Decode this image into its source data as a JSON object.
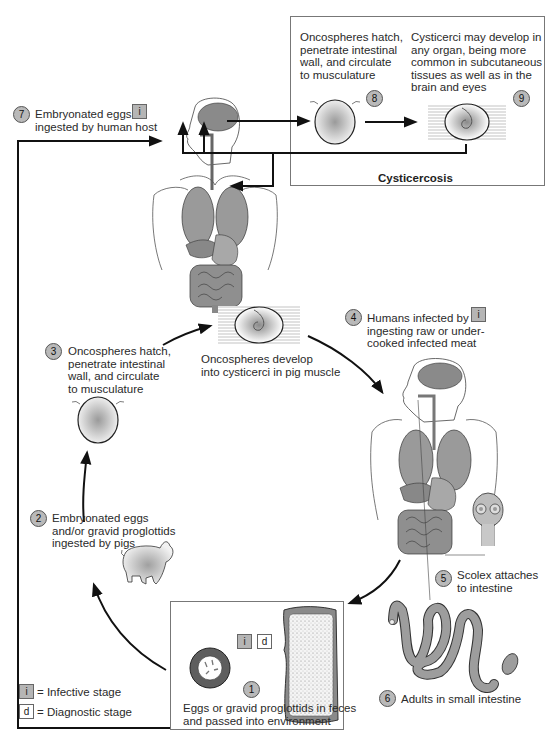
{
  "diagram": {
    "steps": [
      {
        "num": "1",
        "label": "Eggs or gravid proglottids in feces\nand passed into environment",
        "tags": [
          "i",
          "d"
        ]
      },
      {
        "num": "2",
        "label": "Embryonated eggs\nand/or gravid proglottids\ningested by pigs"
      },
      {
        "num": "3",
        "label": "Oncospheres hatch,\npenetrate intestinal\nwall, and circulate\nto musculature"
      },
      {
        "num": "4",
        "label": "Humans infected by\ningesting raw or under-\ncooked infected meat",
        "tags": [
          "i"
        ]
      },
      {
        "num": "5",
        "label": "Scolex attaches\nto intestine"
      },
      {
        "num": "6",
        "label": "Adults in small intestine"
      },
      {
        "num": "7",
        "label": "Embryonated eggs\ningested by human host",
        "tags": [
          "i"
        ]
      },
      {
        "num": "8",
        "label": "Oncospheres hatch,\npenetrate intestinal\nwall, and circulate\nto musculature"
      },
      {
        "num": "9",
        "label": "Cysticerci may develop in\nany organ, being more\ncommon in subcutaneous\ntissues as well as in the\nbrain and eyes"
      }
    ],
    "pig_muscle_label": "Oncospheres develop\ninto cysticerci in pig muscle",
    "cysticercosis_box_title": "Cysticercosis",
    "legend": [
      {
        "tag": "i",
        "label": "= Infective stage"
      },
      {
        "tag": "d",
        "label": "= Diagnostic stage"
      }
    ],
    "icons": {
      "i": "i",
      "d": "d"
    },
    "colors": {
      "tag_infective_fill": "#b5b5b5",
      "step_circle_fill": "#b9b9b9",
      "line": "#111111",
      "organ_gray": "#9a9a9a"
    }
  }
}
